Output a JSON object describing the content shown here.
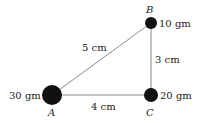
{
  "diagram": {
    "points": [
      {
        "label": "A",
        "mass": "30 gm"
      },
      {
        "label": "B",
        "mass": "10 gm"
      },
      {
        "label": "C",
        "mass": "20 gm"
      }
    ],
    "edges": [
      {
        "from": "A",
        "to": "B",
        "length": "5 cm"
      },
      {
        "from": "B",
        "to": "C",
        "length": "3 cm"
      },
      {
        "from": "A",
        "to": "C",
        "length": "4 cm"
      }
    ],
    "colors": {
      "line": "#8a8a8a",
      "mass": "#111111"
    }
  }
}
